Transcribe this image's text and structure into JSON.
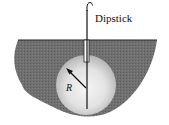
{
  "diagram": {
    "labels": {
      "dipstick": "Dipstick",
      "radius": "R"
    },
    "colors": {
      "ground": "#6e6e6e",
      "ground_texture": "#5f5f5f",
      "sphere_center": "#f4f4f4",
      "sphere_edge": "#b9b9b9",
      "stroke": "#1a1a1a",
      "background": "#ffffff"
    }
  }
}
